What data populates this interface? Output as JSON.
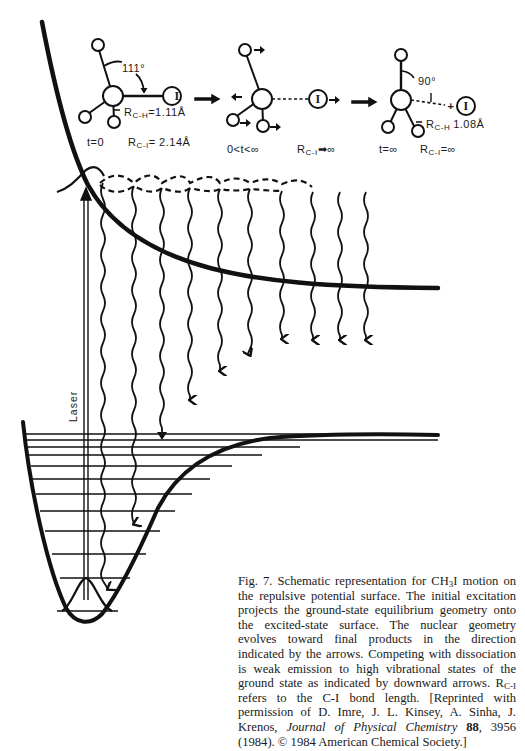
{
  "figure": {
    "number": "Fig. 7.",
    "molecules": [
      {
        "stage": "initial",
        "angle_label": "111°",
        "bond_label_prefix": "R",
        "bond_label_sub": "C-H",
        "bond_label_value": "=1.11Å",
        "atom_label": "I",
        "time_label": "t=0",
        "distance_prefix": "R",
        "distance_sub": "C-I",
        "distance_value": "= 2.14Å"
      },
      {
        "stage": "intermediate",
        "atom_label": "I",
        "time_label": "0<t<∞",
        "distance_prefix": "R",
        "distance_sub": "C-I",
        "distance_value": "➡∞"
      },
      {
        "stage": "final",
        "angle_label": "90°",
        "bond_label_prefix": "R",
        "bond_label_sub": "C-H",
        "bond_label_value": "1.08Å",
        "atom_label": "I",
        "plus_label": "+",
        "time_label": "t=∞",
        "distance_prefix": "R",
        "distance_sub": "C-I",
        "distance_value": "=∞"
      }
    ],
    "laser_label": "Laser",
    "emission_arrows": [
      {
        "x": 103,
        "end_y": 598
      },
      {
        "x": 134,
        "end_y": 548
      },
      {
        "x": 162,
        "end_y": 437
      },
      {
        "x": 190,
        "end_y": 402
      },
      {
        "x": 220,
        "end_y": 372
      },
      {
        "x": 250,
        "end_y": 356
      },
      {
        "x": 282,
        "end_y": 340
      },
      {
        "x": 313,
        "end_y": 340
      },
      {
        "x": 340,
        "end_y": 340
      },
      {
        "x": 366,
        "end_y": 340
      }
    ],
    "vibrational_levels_y": [
      434,
      440,
      447,
      455,
      466,
      479,
      494,
      511,
      531,
      554,
      578,
      602
    ],
    "caption": {
      "part1": "Fig. 7. Schematic representation for CH",
      "sub1": "3",
      "part2": "I motion on the repulsive potential surface. The initial excitation projects the ground-state equilibrium geometry onto the excited-state surface. The nuclear geometry evolves toward final products in the direction indicated by the arrows. Competing with dissociation is weak emission to high vibrational states of the ground state as indicated by downward arrows. R",
      "sub2": "C-I",
      "part3": " refers to the C-I bond length. [Reprinted with permission of D. Imre, J. L. Kinsey, A. Sinha, J. Krenos, ",
      "journal": "Journal of Physical Chemistry",
      "volume": "88",
      "part4": ", 3956 (1984). © 1984 American Chemical Society.]"
    }
  }
}
